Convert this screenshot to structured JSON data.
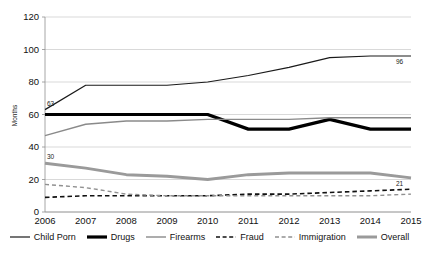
{
  "chart_data": {
    "type": "line",
    "title": "",
    "xlabel": "",
    "ylabel": "Months",
    "ylim": [
      0,
      120
    ],
    "ytick_step": 20,
    "grid": true,
    "legend_position": "bottom",
    "categories": [
      "2006",
      "2007",
      "2008",
      "2009",
      "2010",
      "2011",
      "2012",
      "2013",
      "2014",
      "2015"
    ],
    "series": [
      {
        "name": "Child Porn",
        "color": "#1a1a1a",
        "width": 1.2,
        "dash": "none",
        "values": [
          63,
          78,
          78,
          78,
          80,
          84,
          89,
          95,
          96,
          96
        ]
      },
      {
        "name": "Drugs",
        "color": "#000000",
        "width": 3.2,
        "dash": "none",
        "values": [
          60,
          60,
          60,
          60,
          60,
          51,
          51,
          57,
          51,
          51
        ]
      },
      {
        "name": "Firearms",
        "color": "#8a8a8a",
        "width": 1.4,
        "dash": "none",
        "values": [
          47,
          54,
          56,
          56,
          57,
          57,
          57,
          58,
          58,
          58
        ]
      },
      {
        "name": "Fraud",
        "color": "#111111",
        "width": 1.6,
        "dash": "dashed",
        "values": [
          9,
          10,
          10,
          10,
          10,
          11,
          11,
          12,
          13,
          14
        ]
      },
      {
        "name": "Immigration",
        "color": "#909090",
        "width": 1.4,
        "dash": "dashed",
        "values": [
          17,
          15,
          11,
          10,
          10,
          10,
          10,
          10,
          10,
          11
        ]
      },
      {
        "name": "Overall",
        "color": "#9a9a9a",
        "width": 3.0,
        "dash": "none",
        "values": [
          30,
          27,
          23,
          22,
          20,
          23,
          24,
          24,
          24,
          21
        ]
      }
    ],
    "ytick_labels": [
      "0",
      "20",
      "40",
      "60",
      "80",
      "100",
      "120"
    ],
    "annotations": [
      {
        "text": "63",
        "series": "Child Porn",
        "x": "2006",
        "value": 63
      },
      {
        "text": "96",
        "series": "Child Porn",
        "x": "2015",
        "value": 96
      },
      {
        "text": "30",
        "series": "Overall",
        "x": "2006",
        "value": 30
      },
      {
        "text": "21",
        "series": "Overall",
        "x": "2015",
        "value": 21
      }
    ]
  },
  "axes": {
    "y_title": "Months"
  },
  "legend": {
    "items": [
      {
        "label": "Child Porn"
      },
      {
        "label": "Drugs"
      },
      {
        "label": "Firearms"
      },
      {
        "label": "Fraud"
      },
      {
        "label": "Immigration"
      },
      {
        "label": "Overall"
      }
    ]
  }
}
